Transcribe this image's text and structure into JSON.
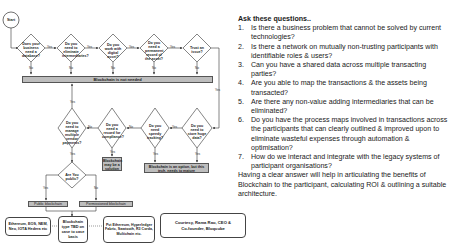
{
  "flowchart": {
    "start_label": "Start",
    "top_row": [
      {
        "question": "Does your business need a database?",
        "yes": "Yes",
        "no": "No"
      },
      {
        "question": "Do you need to eliminate intermediaries?",
        "yes": "Yes",
        "no": "No"
      },
      {
        "question": "Do you work with digital asset?",
        "yes": "Yes",
        "no": "No"
      },
      {
        "question": "Do you need a permanent record of the asset?",
        "yes": "Yes",
        "no": "No"
      },
      {
        "question": "Trust an issue?",
        "yes": "Yes",
        "no": "No"
      }
    ],
    "not_needed_bar": "Blockchain is not needed",
    "second_row": [
      {
        "question": "Do you need to manage multiple vendor payments?",
        "yes": "Yes",
        "no": "No"
      },
      {
        "question": "Do you need a record for compliance?",
        "yes": "Yes",
        "no": "No"
      },
      {
        "question": "Do you need speedy tracking?",
        "yes": "Yes",
        "no": "No"
      },
      {
        "question": "Do you need to store huge data?",
        "yes": "Yes",
        "no": "Yes"
      }
    ],
    "maybe_solution": "Blockchain may be a solution",
    "option_box": "Blockchain is an option, but this tech. needs to mature",
    "public_question": {
      "question": "Are You public?",
      "yes": "Yes",
      "no": "No"
    },
    "public_box": "Public blockchain",
    "permissioned_box": "Permissioned blockchain",
    "public_examples": "Ethereum, EOS, NEM, Neo, IOTA Hedera etc",
    "tbd_box": "Blockchain type TBD on case to case basis",
    "permissioned_examples": "Pvt Ethereum, Hyperledger Fabric, Sawtooth, R3 Corda, Multichain etc.",
    "credit": "Courtesy, Rama Rao, CEO & Co-founder, Bloqcube"
  },
  "questions_panel": {
    "title": "Ask these questions..",
    "items": [
      {
        "num": "1.",
        "text": "Is there a business problem that cannot be solved by current technologies?"
      },
      {
        "num": "2.",
        "text": "Is there a network on mutually non-trusting participants with identifiable roles & users?"
      },
      {
        "num": "3.",
        "text": "Can you have a shared data across multiple transacting  parties?"
      },
      {
        "num": "4.",
        "text": "Are you able to map the transactions & the assets being transacted?"
      },
      {
        "num": "5.",
        "text": "Are there any non-value adding intermediaries that can be eliminated?"
      },
      {
        "num": "6.",
        "text": "Do you have the process maps involved in transactions across the participants that can clearly outlined & improved upon to eliminate wasteful expenses through automation & optimisation?"
      },
      {
        "num": "7.",
        "text": "How do we interact and integrate with the legacy systems of participant organisations?"
      }
    ],
    "summary": "Having a clear answer will help in articulating the benefits of Blockchain to the participant, calculating ROI & outlining a suitable architecture."
  },
  "colors": {
    "gray_fill": "#bdbdbd",
    "line": "#333333"
  }
}
